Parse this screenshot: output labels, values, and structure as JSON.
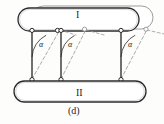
{
  "figure": {
    "caption": "(d)",
    "bodies": [
      {
        "id": "upper",
        "label": "I"
      },
      {
        "id": "lower",
        "label": "II"
      }
    ],
    "angle_labels": [
      "α",
      "α",
      "α"
    ],
    "colors": {
      "stroke": "#2b2b2b",
      "stroke_light": "#8e8e8e",
      "dashed": "#9a9a9a",
      "background": "#fdfdfc",
      "text": "#242424"
    },
    "geometry": {
      "upper_body_solid": {
        "x": 18,
        "y": 8,
        "width": 122,
        "height": 22,
        "rx": 11
      },
      "upper_body_ghost": {
        "x": 32,
        "y": 6,
        "width": 122,
        "height": 22,
        "rx": 11
      },
      "lower_body": {
        "x": 14,
        "y": 82,
        "width": 132,
        "height": 20,
        "rx": 10
      },
      "links": [
        {
          "top_x": 32,
          "top_y": 31,
          "bottom_x": 32,
          "bottom_y": 79,
          "ghost_top_x": 58,
          "ghost_top_y": 29
        },
        {
          "top_x": 61,
          "top_y": 31,
          "bottom_x": 61,
          "bottom_y": 79,
          "ghost_top_x": 84,
          "ghost_top_y": 29
        },
        {
          "top_x": 121,
          "top_y": 31,
          "bottom_x": 121,
          "bottom_y": 79,
          "ghost_top_x": 145,
          "ghost_top_y": 29
        }
      ],
      "pivot_radius": 2.1
    }
  }
}
